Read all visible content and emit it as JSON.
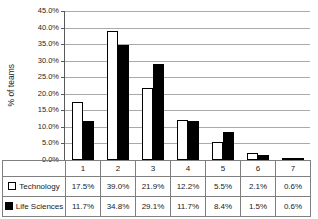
{
  "chart_data": {
    "type": "bar",
    "title": "",
    "xlabel": "",
    "ylabel": "% of teams",
    "ylim": [
      0,
      45
    ],
    "ytick_step": 5,
    "ytick_labels": [
      "0.0%",
      "5.0%",
      "10.0%",
      "15.0%",
      "20.0%",
      "25.0%",
      "30.0%",
      "35.0%",
      "40.0%",
      "45.0%"
    ],
    "grid": true,
    "legend_position": "bottom-table",
    "categories": [
      "1",
      "2",
      "3",
      "4",
      "5",
      "6",
      "7"
    ],
    "series": [
      {
        "name": "Technology",
        "values": [
          17.5,
          39.0,
          21.9,
          12.2,
          5.5,
          2.1,
          0.6
        ],
        "value_labels": [
          "17.5%",
          "39.0%",
          "21.9%",
          "12.2%",
          "5.5%",
          "2.1%",
          "0.6%"
        ],
        "fill": "#ffffff",
        "border": "#000000"
      },
      {
        "name": "Life Sciences",
        "values": [
          11.7,
          34.8,
          29.1,
          11.7,
          8.4,
          1.5,
          0.6
        ],
        "value_labels": [
          "11.7%",
          "34.8%",
          "29.1%",
          "11.7%",
          "8.4%",
          "1.5%",
          "0.6%"
        ],
        "fill": "#000000",
        "border": "#000000"
      }
    ]
  },
  "colors": {
    "gridline": "#aaaaaa",
    "axis": "#595959",
    "table_border": "#7f7f7f",
    "text": "#262626"
  }
}
